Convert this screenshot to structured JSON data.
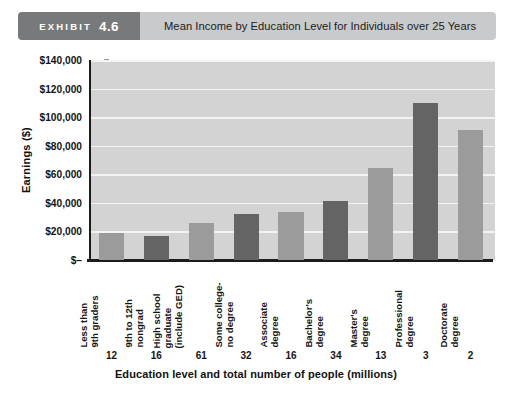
{
  "header": {
    "exhibit_word": "EXHIBIT",
    "exhibit_number": "4.6",
    "title": "Mean Income by Education Level for Individuals over 25 Years"
  },
  "chart_data": {
    "type": "bar",
    "title": "Mean Income by Education Level for Individuals over 25 Years",
    "xlabel": "Education level and total number of people (millions)",
    "ylabel": "Earnings ($)",
    "ylim": [
      0,
      140000
    ],
    "ytick_labels": [
      "$140,000",
      "$120,000",
      "$100,000",
      "$80,000",
      "$60,000",
      "$40,000",
      "$20,000",
      "$–"
    ],
    "ytick_values": [
      140000,
      120000,
      100000,
      80000,
      60000,
      40000,
      20000,
      0
    ],
    "grid": true,
    "legend": "none",
    "categories": [
      "Less than 9th graders",
      "9th to 12th nongrad",
      "High school graduate (include GED)",
      "Some college-no degree",
      "Associate degree",
      "Bachelor's degree",
      "Master's degree",
      "Professional degree",
      "Doctorate degree"
    ],
    "category_lines": [
      [
        "Less than",
        "9th graders"
      ],
      [
        "9th to 12th",
        "nongrad"
      ],
      [
        "High school",
        "graduate",
        "(include GED)"
      ],
      [
        "Some college-",
        "no degree"
      ],
      [
        "Associate",
        "degree"
      ],
      [
        "Bachelor's",
        "degree"
      ],
      [
        "Master's",
        "degree"
      ],
      [
        "Professional",
        "degree"
      ],
      [
        "Doctorate",
        "degree"
      ]
    ],
    "values": [
      19000,
      16500,
      26000,
      32000,
      33500,
      41000,
      64500,
      110000,
      91000
    ],
    "population_millions": [
      12,
      16,
      61,
      32,
      16,
      34,
      13,
      3,
      2
    ],
    "bar_colors": [
      "#9b9b9b",
      "#646464",
      "#9b9b9b",
      "#646464",
      "#9b9b9b",
      "#646464",
      "#9b9b9b",
      "#646464",
      "#9b9b9b"
    ],
    "plot_background": "#d3d3d3",
    "gridline_color": "#f3f3f3"
  }
}
